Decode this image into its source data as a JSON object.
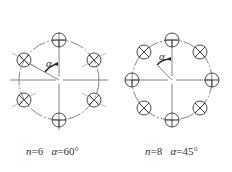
{
  "figures": [
    {
      "id": "six-hole",
      "n": 6,
      "alpha_deg": 60,
      "caption_n_label": "n",
      "caption_n_value": "=6",
      "caption_alpha_label": "α",
      "caption_alpha_value": "=60°",
      "angle_symbol": "α"
    },
    {
      "id": "eight-hole",
      "n": 8,
      "alpha_deg": 45,
      "caption_n_label": "n",
      "caption_n_value": "=8",
      "caption_alpha_label": "α",
      "caption_alpha_value": "=45°",
      "angle_symbol": "α"
    }
  ],
  "colors": {
    "line": "#555555",
    "hole": "#333333",
    "text": "#333333"
  }
}
